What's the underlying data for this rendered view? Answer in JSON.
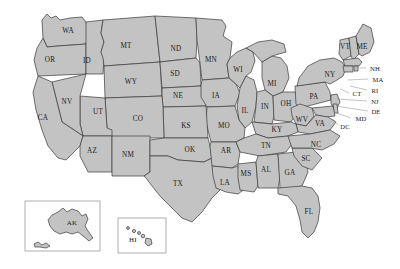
{
  "map": {
    "title": "United States state abbreviation map",
    "background_color": "#ffffff",
    "state_fill_color": "#c3c3c3",
    "state_border_color": "#3a3a3a",
    "leader_line_color": "#9a9a9a",
    "label_color": "#1a1a1a",
    "inset_border_color": "#8e8e8e"
  },
  "states": [
    {
      "code": "WA",
      "x": 68,
      "y": 31
    },
    {
      "code": "OR",
      "x": 50,
      "y": 60
    },
    {
      "code": "ID",
      "x": 87,
      "y": 61
    },
    {
      "code": "MT",
      "x": 126,
      "y": 46
    },
    {
      "code": "ND",
      "x": 176,
      "y": 49
    },
    {
      "code": "MN",
      "x": 211,
      "y": 60
    },
    {
      "code": "WI",
      "x": 238,
      "y": 70
    },
    {
      "code": "MI",
      "x": 272,
      "y": 84
    },
    {
      "code": "SD",
      "x": 175,
      "y": 74
    },
    {
      "code": "WY",
      "x": 131,
      "y": 82
    },
    {
      "code": "NE",
      "x": 178,
      "y": 96
    },
    {
      "code": "IA",
      "x": 216,
      "y": 96
    },
    {
      "code": "IL",
      "x": 245,
      "y": 111
    },
    {
      "code": "IN",
      "x": 265,
      "y": 107
    },
    {
      "code": "OH",
      "x": 286,
      "y": 104
    },
    {
      "code": "PA",
      "x": 314,
      "y": 97
    },
    {
      "code": "NY",
      "x": 330,
      "y": 75
    },
    {
      "code": "VT",
      "x": 345,
      "y": 47
    },
    {
      "code": "ME",
      "x": 362,
      "y": 47
    },
    {
      "code": "NV",
      "x": 67,
      "y": 102
    },
    {
      "code": "UT",
      "x": 98,
      "y": 112
    },
    {
      "code": "CA",
      "x": 43,
      "y": 118
    },
    {
      "code": "CO",
      "x": 138,
      "y": 119
    },
    {
      "code": "KS",
      "x": 186,
      "y": 126
    },
    {
      "code": "MO",
      "x": 224,
      "y": 126
    },
    {
      "code": "KY",
      "x": 277,
      "y": 130
    },
    {
      "code": "WV",
      "x": 302,
      "y": 120
    },
    {
      "code": "VA",
      "x": 320,
      "y": 124
    },
    {
      "code": "AZ",
      "x": 92,
      "y": 151
    },
    {
      "code": "NM",
      "x": 128,
      "y": 155
    },
    {
      "code": "OK",
      "x": 190,
      "y": 150
    },
    {
      "code": "AR",
      "x": 226,
      "y": 151
    },
    {
      "code": "TN",
      "x": 266,
      "y": 146
    },
    {
      "code": "NC",
      "x": 316,
      "y": 145
    },
    {
      "code": "SC",
      "x": 306,
      "y": 159
    },
    {
      "code": "MS",
      "x": 246,
      "y": 174
    },
    {
      "code": "AL",
      "x": 266,
      "y": 170
    },
    {
      "code": "GA",
      "x": 290,
      "y": 173
    },
    {
      "code": "LA",
      "x": 225,
      "y": 183
    },
    {
      "code": "TX",
      "x": 178,
      "y": 184
    },
    {
      "code": "FL",
      "x": 309,
      "y": 212
    }
  ],
  "callout_states": [
    {
      "code": "NH",
      "x": 375,
      "y": 68,
      "line": {
        "x1": 352,
        "y1": 68,
        "x2": 366,
        "y2": 68
      }
    },
    {
      "code": "MA",
      "x": 378,
      "y": 79,
      "line": {
        "x1": 348,
        "y1": 80,
        "x2": 368,
        "y2": 79
      }
    },
    {
      "code": "RI",
      "x": 375,
      "y": 90,
      "line": {
        "x1": 350,
        "y1": 86,
        "x2": 367,
        "y2": 90
      }
    },
    {
      "code": "CT",
      "x": 357,
      "y": 93,
      "line": {
        "x1": 340,
        "y1": 89,
        "x2": 349,
        "y2": 93
      }
    },
    {
      "code": "NJ",
      "x": 375,
      "y": 101,
      "line": {
        "x1": 337,
        "y1": 99,
        "x2": 367,
        "y2": 101
      }
    },
    {
      "code": "DE",
      "x": 376,
      "y": 111,
      "line": {
        "x1": 336,
        "y1": 106,
        "x2": 368,
        "y2": 111
      }
    },
    {
      "code": "MD",
      "x": 361,
      "y": 118,
      "line": {
        "x1": 334,
        "y1": 112,
        "x2": 351,
        "y2": 118
      }
    },
    {
      "code": "DC",
      "x": 345,
      "y": 126,
      "line": {
        "x1": 333,
        "y1": 119,
        "x2": 338,
        "y2": 125
      }
    }
  ],
  "insets": [
    {
      "name": "alaska-inset",
      "code": "AK",
      "label_x": 72,
      "label_y": 223,
      "frame": {
        "x": 25,
        "y": 201,
        "width": 75,
        "height": 50
      }
    },
    {
      "name": "hawaii-inset",
      "code": "HI",
      "label_x": 133,
      "label_y": 240,
      "frame": {
        "x": 118,
        "y": 218,
        "width": 48,
        "height": 35
      }
    }
  ]
}
